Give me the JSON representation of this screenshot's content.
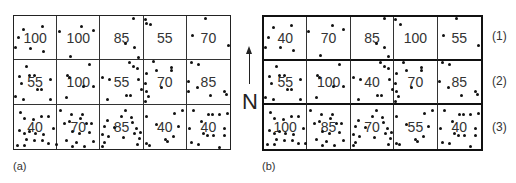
{
  "panel_a": {
    "label": "(a)",
    "rows": [
      [
        "100",
        "100",
        "85",
        "55",
        "70"
      ],
      [
        "55",
        "100",
        "55",
        "70",
        "85"
      ],
      [
        "40",
        "70",
        "85",
        "40",
        "40"
      ]
    ]
  },
  "panel_b": {
    "label": "(b)",
    "rows": [
      [
        "40",
        "70",
        "85",
        "100",
        "55"
      ],
      [
        "55",
        "100",
        "40",
        "70",
        "85"
      ],
      [
        "100",
        "85",
        "70",
        "55",
        "40"
      ]
    ],
    "row_labels": [
      "(1)",
      "(2)",
      "(3)"
    ]
  },
  "north_arrow": {
    "letter": "N",
    "icon": "north-arrow-icon"
  }
}
